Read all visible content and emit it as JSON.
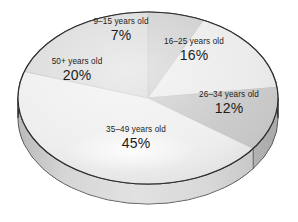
{
  "chart_data": {
    "type": "pie",
    "title": "",
    "subtitle": "",
    "xlabel": "",
    "ylabel": "",
    "grid": false,
    "legend_position": "none",
    "label_style": "on-slice",
    "units": "percent",
    "total": 100,
    "three_d": true,
    "categories": [
      "9–15 years old",
      "16–25 years old",
      "26–34 years old",
      "35–49 years old",
      "50+ years old"
    ],
    "values": [
      7,
      16,
      12,
      45,
      20
    ],
    "value_labels": [
      "7%",
      "16%",
      "12%",
      "45%",
      "20%"
    ],
    "slices": [
      {
        "label": "9–15 years old",
        "value": 7,
        "value_label": "7%",
        "color": "#c9c9c9",
        "side_color": "#b0b0b0"
      },
      {
        "label": "16–25 years old",
        "value": 16,
        "value_label": "16%",
        "color": "#e9e9e9",
        "side_color": "#cfcfcf"
      },
      {
        "label": "26–34 years old",
        "value": 12,
        "value_label": "12%",
        "color": "#c5c5c5",
        "side_color": "#adadad"
      },
      {
        "label": "35–49 years old",
        "value": 45,
        "value_label": "45%",
        "color": "#ededed",
        "side_color": "#d4d4d4"
      },
      {
        "label": "50+ years old",
        "value": 20,
        "value_label": "20%",
        "color": "#d6d6d6",
        "side_color": "#bcbcbc"
      }
    ],
    "colors": {
      "background": "#ffffff",
      "outline": "#2a2a2a",
      "text": "#1c1c1c"
    }
  }
}
